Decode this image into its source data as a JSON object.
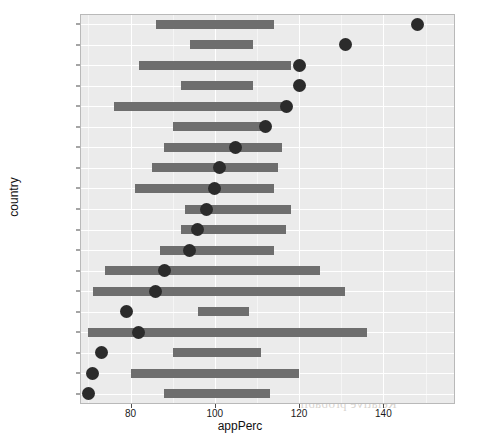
{
  "chart_data": {
    "type": "bar",
    "title": "",
    "subtitle": "",
    "xlabel": "appPerc",
    "ylabel": "country",
    "xlim": [
      68,
      157
    ],
    "xticks": [
      80,
      100,
      120,
      140
    ],
    "xtick_labels": [
      "80",
      "100",
      "120",
      "140"
    ],
    "minor_xticks": [
      70,
      90,
      110,
      130,
      150
    ],
    "grid": true,
    "legend": null,
    "orientation": "horizontal",
    "categories": [
      "Bulgaria",
      "Romania",
      "Greece",
      "Italy",
      "Czech Republic",
      "Spain",
      "Portugal",
      "Latvia",
      "Netherlands",
      "Lithuania",
      "Slovakia",
      "Hungary",
      "Belgium",
      "Denmark",
      "Poland",
      "Finland",
      "France",
      "Sweden",
      "Germany"
    ],
    "series": [
      {
        "name": "range bar",
        "type": "range",
        "low": [
          86,
          94,
          82,
          92,
          76,
          90,
          88,
          85,
          81,
          93,
          92,
          87,
          74,
          71,
          96,
          70,
          90,
          80,
          88
        ],
        "high": [
          114,
          109,
          118,
          109,
          117,
          113,
          116,
          115,
          114,
          118,
          117,
          114,
          125,
          131,
          108,
          136,
          111,
          120,
          113
        ]
      },
      {
        "name": "point estimate",
        "type": "point",
        "values": [
          148,
          131,
          120,
          120,
          117,
          112,
          105,
          101,
          100,
          98,
          96,
          94,
          88,
          86,
          79,
          82,
          73,
          71,
          70
        ]
      }
    ],
    "rows": [
      {
        "country": "Bulgaria",
        "low": 86,
        "high": 114,
        "point": 148
      },
      {
        "country": "Romania",
        "low": 94,
        "high": 109,
        "point": 131
      },
      {
        "country": "Greece",
        "low": 82,
        "high": 118,
        "point": 120
      },
      {
        "country": "Italy",
        "low": 92,
        "high": 109,
        "point": 120
      },
      {
        "country": "Czech Republic",
        "low": 76,
        "high": 117,
        "point": 117
      },
      {
        "country": "Spain",
        "low": 90,
        "high": 113,
        "point": 112
      },
      {
        "country": "Portugal",
        "low": 88,
        "high": 116,
        "point": 105
      },
      {
        "country": "Latvia",
        "low": 85,
        "high": 115,
        "point": 101
      },
      {
        "country": "Netherlands",
        "low": 81,
        "high": 114,
        "point": 100
      },
      {
        "country": "Lithuania",
        "low": 93,
        "high": 118,
        "point": 98
      },
      {
        "country": "Slovakia",
        "low": 92,
        "high": 117,
        "point": 96
      },
      {
        "country": "Hungary",
        "low": 87,
        "high": 114,
        "point": 94
      },
      {
        "country": "Belgium",
        "low": 74,
        "high": 125,
        "point": 88
      },
      {
        "country": "Denmark",
        "low": 71,
        "high": 131,
        "point": 86
      },
      {
        "country": "Poland",
        "low": 96,
        "high": 108,
        "point": 79
      },
      {
        "country": "Finland",
        "low": 70,
        "high": 136,
        "point": 82
      },
      {
        "country": "France",
        "low": 90,
        "high": 111,
        "point": 73
      },
      {
        "country": "Sweden",
        "low": 80,
        "high": 120,
        "point": 71
      },
      {
        "country": "Germany",
        "low": 88,
        "high": 113,
        "point": 70
      }
    ],
    "colors": {
      "panel_background": "#ebebeb",
      "grid_major": "#ffffff",
      "grid_minor": "#f5f5f5",
      "bar": "#6e6e6e",
      "point": "#2b2b2b",
      "text": "#1a1a1a"
    }
  },
  "bleed_text": [
    "not only did the",
    "they suggested that",
    "Relative probabil"
  ]
}
